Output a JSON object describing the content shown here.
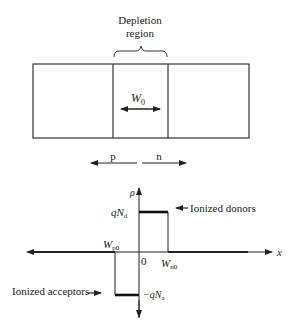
{
  "top_diagram": {
    "depletion_label_line1": "Depletion",
    "depletion_label_line2": "region",
    "width_label": "W",
    "width_sub": "0",
    "p_label": "p",
    "n_label": "n"
  },
  "charge_plot": {
    "y_axis_label": "ρ",
    "x_axis_label": "x",
    "origin_label": "0",
    "wp_label": "W",
    "wp_sub": "p0",
    "wn_label": "W",
    "wn_sub": "n0",
    "donor_level_q": "q",
    "donor_level_N": "N",
    "donor_level_sub": "d",
    "acceptor_level_q": "−q",
    "acceptor_level_N": "N",
    "acceptor_level_sub": "a",
    "donors_annotation": "Ionized donors",
    "acceptors_annotation": "Ionized acceptors"
  },
  "colors": {
    "line": "#222222",
    "background": "#ffffff"
  }
}
